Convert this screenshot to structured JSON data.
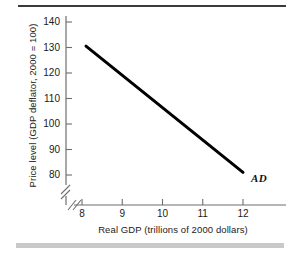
{
  "figure": {
    "top_rule": "top-rule",
    "bottom_bar": "bottom-bar"
  },
  "chart_data": {
    "type": "line",
    "title": "",
    "xlabel": "Real GDP (trillions of 2000 dollars)",
    "ylabel": "Price level (GDP deflator, 2000 = 100)",
    "xlim": [
      7.4,
      12.8
    ],
    "ylim": [
      74,
      145
    ],
    "xticks": [
      8,
      9,
      10,
      11,
      12
    ],
    "xtick_labels": [
      "8",
      "9",
      "10",
      "11",
      "12"
    ],
    "yticks": [
      80,
      90,
      100,
      110,
      120,
      130,
      140
    ],
    "ytick_labels": [
      "80",
      "90",
      "100",
      "110",
      "120",
      "130",
      "140"
    ],
    "grid": false,
    "legend_position": "inline-right",
    "axis_break_x": true,
    "axis_break_y": true,
    "line_color": "#000000",
    "line_width": 3,
    "series": [
      {
        "name": "AD",
        "label": "AD",
        "x": [
          8.1,
          12.0
        ],
        "y": [
          130.5,
          81.0
        ]
      }
    ],
    "annotations": [
      {
        "text": "AD",
        "x": 12.2,
        "y": 78.5
      }
    ]
  }
}
